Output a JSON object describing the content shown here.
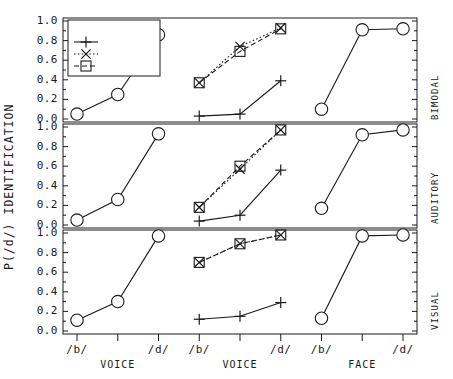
{
  "axes": {
    "ylabel": "P(/d/) IDENTIFICATION",
    "yticks": [
      "1.0",
      "0.8",
      "0.6",
      "0.4",
      "0.2",
      "0.0"
    ],
    "ylim": [
      0,
      1
    ],
    "xticks": [
      "/b/",
      "/d/",
      "/b/",
      "/d/",
      "/b/",
      "/d/"
    ],
    "xgroups": [
      "VOICE",
      "VOICE",
      "FACE"
    ]
  },
  "legend": {
    "title": "FACE",
    "items": [
      {
        "label": "/b/",
        "marker": "plus",
        "line": "solid"
      },
      {
        "label": "NEUT",
        "marker": "cross-x",
        "line": "dotted"
      },
      {
        "label": "/d/",
        "marker": "square",
        "line": "dashed"
      }
    ]
  },
  "panels": [
    {
      "name": "BIMODAL"
    },
    {
      "name": "AUDITORY"
    },
    {
      "name": "VISUAL"
    }
  ],
  "chart_data": {
    "type": "line",
    "title": "",
    "xlabel": "",
    "ylabel": "P(/d/) IDENTIFICATION",
    "ylim": [
      0,
      1
    ],
    "grid": false,
    "legend_position": "top-left",
    "legend_title": "FACE",
    "xtick_labels": [
      "/b/",
      "/d/",
      "/b/",
      "/d/",
      "/b/",
      "/d/"
    ],
    "xgroup_labels": [
      "VOICE",
      "VOICE",
      "FACE"
    ],
    "x_clusters": [
      {
        "name": "VOICE",
        "x": [
          1,
          2,
          3
        ]
      },
      {
        "name": "VOICE",
        "x": [
          4,
          5,
          6
        ]
      },
      {
        "name": "FACE",
        "x": [
          7,
          8,
          9
        ]
      }
    ],
    "panels": [
      {
        "name": "BIMODAL",
        "series": [
          {
            "name": "voice-continuum",
            "marker": "circle",
            "line": "solid",
            "cluster": 1,
            "x": [
              1,
              2,
              3
            ],
            "values": [
              0.05,
              0.25,
              0.86
            ]
          },
          {
            "name": "/b/",
            "marker": "plus",
            "line": "solid",
            "cluster": 2,
            "x": [
              4,
              5,
              6
            ],
            "values": [
              0.03,
              0.05,
              0.39
            ]
          },
          {
            "name": "NEUT",
            "marker": "cross-x",
            "line": "dotted",
            "cluster": 2,
            "x": [
              4,
              5,
              6
            ],
            "values": [
              0.37,
              0.74,
              0.93
            ]
          },
          {
            "name": "/d/",
            "marker": "square",
            "line": "dashed",
            "cluster": 2,
            "x": [
              4,
              5,
              6
            ],
            "values": [
              0.37,
              0.69,
              0.92
            ]
          },
          {
            "name": "face-continuum",
            "marker": "circle",
            "line": "solid",
            "cluster": 3,
            "x": [
              7,
              8,
              9
            ],
            "values": [
              0.1,
              0.91,
              0.92
            ]
          }
        ]
      },
      {
        "name": "AUDITORY",
        "series": [
          {
            "name": "voice-continuum",
            "marker": "circle",
            "line": "solid",
            "cluster": 1,
            "x": [
              1,
              2,
              3
            ],
            "values": [
              0.05,
              0.26,
              0.93
            ]
          },
          {
            "name": "/b/",
            "marker": "plus",
            "line": "solid",
            "cluster": 2,
            "x": [
              4,
              5,
              6
            ],
            "values": [
              0.04,
              0.1,
              0.56
            ]
          },
          {
            "name": "NEUT",
            "marker": "cross-x",
            "line": "dotted",
            "cluster": 2,
            "x": [
              4,
              5,
              6
            ],
            "values": [
              0.18,
              0.57,
              0.97
            ]
          },
          {
            "name": "/d/",
            "marker": "square",
            "line": "dashed",
            "cluster": 2,
            "x": [
              4,
              5,
              6
            ],
            "values": [
              0.18,
              0.6,
              0.97
            ]
          },
          {
            "name": "face-continuum",
            "marker": "circle",
            "line": "solid",
            "cluster": 3,
            "x": [
              7,
              8,
              9
            ],
            "values": [
              0.17,
              0.92,
              0.97
            ]
          }
        ]
      },
      {
        "name": "VISUAL",
        "series": [
          {
            "name": "voice-continuum",
            "marker": "circle",
            "line": "solid",
            "cluster": 1,
            "x": [
              1,
              2,
              3
            ],
            "values": [
              0.11,
              0.3,
              0.97
            ]
          },
          {
            "name": "/b/",
            "marker": "plus",
            "line": "solid",
            "cluster": 2,
            "x": [
              4,
              5,
              6
            ],
            "values": [
              0.12,
              0.15,
              0.29
            ]
          },
          {
            "name": "NEUT",
            "marker": "cross-x",
            "line": "dotted",
            "cluster": 2,
            "x": [
              4,
              5,
              6
            ],
            "values": [
              0.7,
              0.89,
              0.98
            ]
          },
          {
            "name": "/d/",
            "marker": "square",
            "line": "dashed",
            "cluster": 2,
            "x": [
              4,
              5,
              6
            ],
            "values": [
              0.7,
              0.89,
              0.98
            ]
          },
          {
            "name": "face-continuum",
            "marker": "circle",
            "line": "solid",
            "cluster": 3,
            "x": [
              7,
              8,
              9
            ],
            "values": [
              0.13,
              0.97,
              0.98
            ]
          }
        ]
      }
    ]
  }
}
